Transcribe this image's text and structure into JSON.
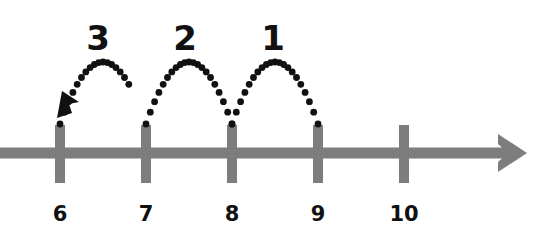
{
  "chart_data": {
    "type": "line",
    "title": "",
    "subtitle": "",
    "xlabel": "",
    "ylabel": "",
    "grid": false,
    "legend": "none",
    "axis": {
      "orientation": "horizontal",
      "arrow_direction": "right",
      "color": "#7d7d7d",
      "line_thickness_px": 11,
      "y_px": 153,
      "start_x_px": 0,
      "end_x_px": 527
    },
    "ticks": [
      {
        "label": "6",
        "value": 6,
        "x_px": 60
      },
      {
        "label": "7",
        "value": 7,
        "x_px": 146
      },
      {
        "label": "8",
        "value": 8,
        "x_px": 232
      },
      {
        "label": "9",
        "value": 9,
        "x_px": 318
      },
      {
        "label": "10",
        "value": 10,
        "x_px": 404
      }
    ],
    "tick_labels": [
      "6",
      "7",
      "8",
      "9",
      "10"
    ],
    "tick_values": [
      6,
      7,
      8,
      9,
      10
    ],
    "xlim": [
      6,
      10
    ],
    "jumps": [
      {
        "label": "3",
        "count": 3,
        "from_value": 7,
        "to_value": 6,
        "from_x_px": 146,
        "to_x_px": 60,
        "direction": "left",
        "has_arrowhead": true,
        "label_x_px": 98,
        "label_y_px": 50
      },
      {
        "label": "2",
        "count": 2,
        "from_value": 8,
        "to_value": 7,
        "from_x_px": 232,
        "to_x_px": 146,
        "direction": "left",
        "has_arrowhead": false,
        "label_x_px": 185,
        "label_y_px": 50
      },
      {
        "label": "1",
        "count": 1,
        "from_value": 9,
        "to_value": 8,
        "from_x_px": 318,
        "to_x_px": 232,
        "direction": "left",
        "has_arrowhead": false,
        "label_x_px": 273,
        "label_y_px": 50
      }
    ],
    "jump_labels": [
      "3",
      "2",
      "1"
    ],
    "jump_values": [
      3,
      2,
      1
    ],
    "colors": {
      "background": "#ffffff",
      "axis": "#7d7d7d",
      "tick_mark": "#7d7d7d",
      "text": "#111111",
      "arc_dots": "#111111",
      "arrowhead": "#111111"
    }
  }
}
